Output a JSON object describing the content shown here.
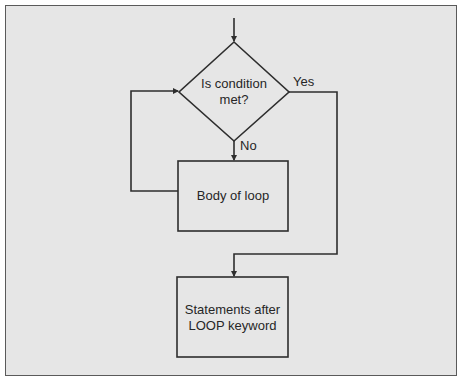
{
  "diagram": {
    "type": "flowchart",
    "colors": {
      "background": "#e6e6e6",
      "stroke": "#2e2e2e",
      "text": "#262626"
    },
    "nodes": {
      "decision": {
        "label": "Is condition met?",
        "line1": "Is condition",
        "line2": "met?"
      },
      "body": {
        "label": "Body of loop"
      },
      "after": {
        "label": "Statements after LOOP keyword",
        "line1": "Statements after",
        "line2": "LOOP keyword"
      }
    },
    "edges": {
      "yes_label": "Yes",
      "no_label": "No"
    }
  }
}
